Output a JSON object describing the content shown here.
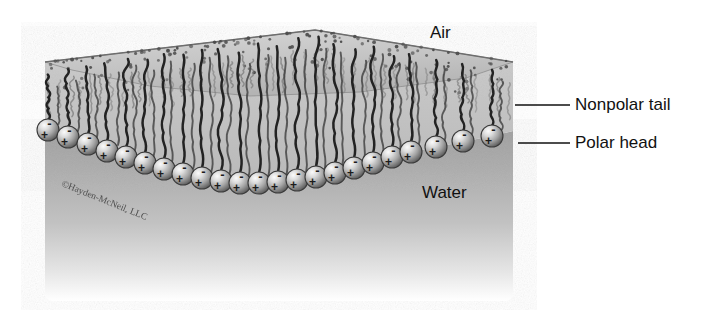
{
  "figure": {
    "type": "scientific-illustration",
    "background_color": "#ffffff"
  },
  "labels": {
    "air": "Air",
    "water": "Water",
    "nonpolar_tail": "Nonpolar tail",
    "polar_head": "Polar head"
  },
  "copyright": "©Hayden-McNeil, LLC",
  "colors": {
    "text": "#111111",
    "leader_line": "#111111",
    "water_top": "#a8a8a8",
    "water_bottom": "#ffffff",
    "film_top_surface": "#c9c9c9",
    "sphere_light": "#f2f2f2",
    "sphere_mid": "#9a9a9a",
    "sphere_dark": "#4a4a4a",
    "tail_stroke": "#2b2b2b"
  },
  "diagram_data": {
    "molecule_count": 23,
    "head_charges": [
      "-",
      "+"
    ],
    "head_radius_px": 11,
    "apex": {
      "x": 315,
      "y": 30
    },
    "left_edge_x": 45,
    "right_edge_x": 513,
    "water_bottom_y": 300,
    "head_row_points": [
      {
        "x": 48,
        "y": 130
      },
      {
        "x": 68,
        "y": 137
      },
      {
        "x": 88,
        "y": 144
      },
      {
        "x": 107,
        "y": 151
      },
      {
        "x": 126,
        "y": 157
      },
      {
        "x": 145,
        "y": 163
      },
      {
        "x": 164,
        "y": 169
      },
      {
        "x": 183,
        "y": 174
      },
      {
        "x": 202,
        "y": 178
      },
      {
        "x": 221,
        "y": 181
      },
      {
        "x": 240,
        "y": 183
      },
      {
        "x": 259,
        "y": 183
      },
      {
        "x": 278,
        "y": 182
      },
      {
        "x": 297,
        "y": 180
      },
      {
        "x": 316,
        "y": 177
      },
      {
        "x": 335,
        "y": 173
      },
      {
        "x": 354,
        "y": 168
      },
      {
        "x": 373,
        "y": 163
      },
      {
        "x": 392,
        "y": 157
      },
      {
        "x": 411,
        "y": 152
      },
      {
        "x": 436,
        "y": 147
      },
      {
        "x": 463,
        "y": 141
      },
      {
        "x": 492,
        "y": 136
      }
    ]
  },
  "leader_lines": [
    {
      "name": "nonpolar-tail-leader",
      "x1": 515,
      "y1": 105,
      "x2": 570,
      "y2": 105
    },
    {
      "name": "polar-head-leader",
      "x1": 518,
      "y1": 143,
      "x2": 570,
      "y2": 143
    }
  ]
}
